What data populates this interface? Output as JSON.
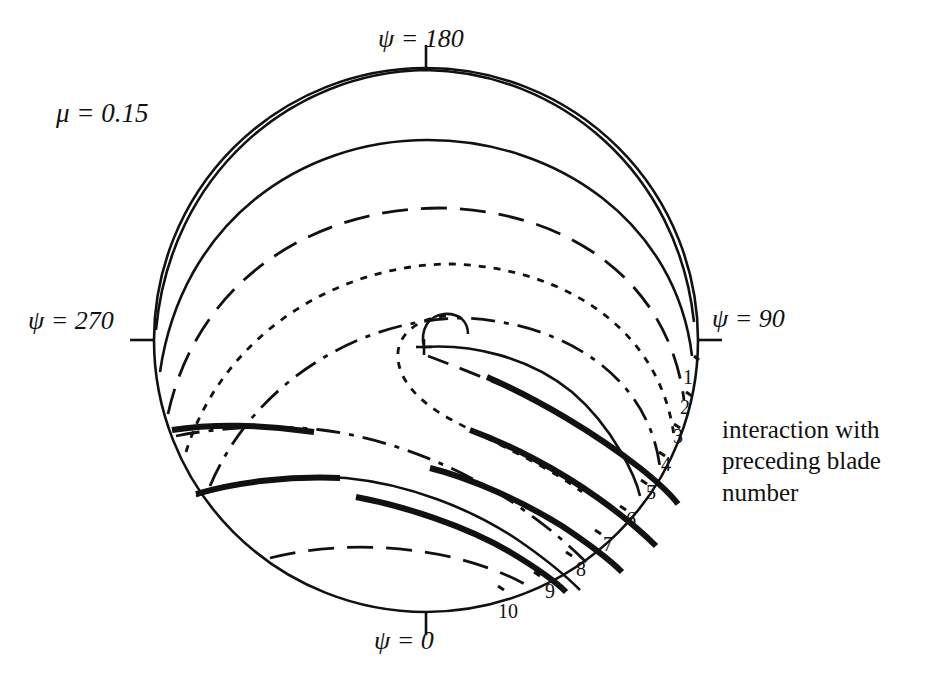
{
  "figure": {
    "type": "rotor-wake-blade-vortex-interaction-polar-diagram",
    "advance_ratio_label": "μ = 0.15",
    "azimuth_labels": {
      "top": "ψ = 180",
      "right": "ψ = 90",
      "left": "ψ = 270",
      "bottom": "ψ = 0"
    },
    "caption_lines": [
      "interaction with",
      "preceding blade",
      "number"
    ],
    "interaction_numbers": [
      "1",
      "2",
      "3",
      "4",
      "5",
      "6",
      "7",
      "8",
      "9",
      "10"
    ],
    "colors": {
      "ink": "#111111",
      "background": "#ffffff"
    }
  },
  "chart_data": {
    "type": "line",
    "title": "",
    "subtitle": "",
    "xlabel": "",
    "ylabel": "",
    "grid": false,
    "legend_position": "none",
    "coordinate_system": "polar rotor disk, azimuth psi in degrees measured counter-clockwise with psi=0 at bottom, psi=90 at right, psi=180 at top, psi=270 at left",
    "annotations": [
      {
        "text": "μ = 0.15",
        "x": 56,
        "y": 98
      },
      {
        "text": "ψ = 180",
        "x": 378,
        "y": 24
      },
      {
        "text": "ψ = 90",
        "x": 712,
        "y": 304
      },
      {
        "text": "ψ = 270",
        "x": 28,
        "y": 306
      },
      {
        "text": "ψ = 0",
        "x": 374,
        "y": 626
      },
      {
        "text": "interaction with preceding blade number",
        "x": 722,
        "y": 414
      }
    ],
    "disk": {
      "cx": 426,
      "cy": 340,
      "r": 272
    },
    "vortex_origin": {
      "x": 424,
      "y": 347
    },
    "tick_marks": [
      {
        "azimuth_deg": 180,
        "x1": 426,
        "y1": 68,
        "x2": 426,
        "y2": 46
      },
      {
        "azimuth_deg": 90,
        "x1": 698,
        "y1": 340,
        "x2": 722,
        "y2": 340
      },
      {
        "azimuth_deg": 270,
        "x1": 154,
        "y1": 340,
        "x2": 130,
        "y2": 340
      },
      {
        "azimuth_deg": 0,
        "x1": 426,
        "y1": 612,
        "x2": 426,
        "y2": 634
      }
    ],
    "number_label_positions": [
      {
        "n": "1",
        "x": 683,
        "y": 366
      },
      {
        "n": "2",
        "x": 680,
        "y": 396
      },
      {
        "n": "3",
        "x": 673,
        "y": 425
      },
      {
        "n": "4",
        "x": 661,
        "y": 453
      },
      {
        "n": "5",
        "x": 646,
        "y": 481
      },
      {
        "n": "6",
        "x": 626,
        "y": 508
      },
      {
        "n": "7",
        "x": 603,
        "y": 533
      },
      {
        "n": "8",
        "x": 576,
        "y": 558
      },
      {
        "n": "9",
        "x": 545,
        "y": 580
      },
      {
        "n": "10",
        "x": 498,
        "y": 600
      }
    ],
    "series": [
      {
        "name": "wake-trace-1",
        "style": "solid-thin",
        "interaction_number": "1"
      },
      {
        "name": "wake-trace-2",
        "style": "dash-dot",
        "interaction_number": "2"
      },
      {
        "name": "wake-trace-3",
        "style": "dotted",
        "interaction_number": "3"
      },
      {
        "name": "wake-trace-4",
        "style": "dashed",
        "interaction_number": "4"
      },
      {
        "name": "wake-trace-5",
        "style": "solid-thick",
        "interaction_number": "5"
      },
      {
        "name": "wake-trace-6",
        "style": "solid-thick",
        "interaction_number": "6"
      },
      {
        "name": "wake-trace-7",
        "style": "solid-thick",
        "interaction_number": "7"
      },
      {
        "name": "wake-trace-8",
        "style": "solid-thick",
        "interaction_number": "8"
      },
      {
        "name": "wake-trace-9",
        "style": "solid-thick",
        "interaction_number": "9"
      },
      {
        "name": "wake-trace-10",
        "style": "dashed",
        "interaction_number": "10"
      }
    ]
  }
}
